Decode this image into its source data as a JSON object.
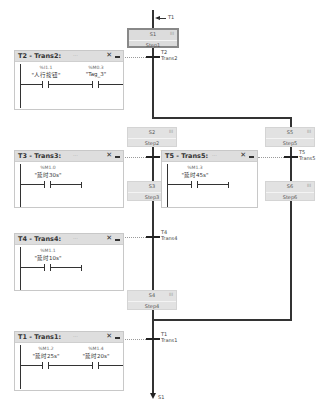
{
  "top_jump": {
    "label": "T1"
  },
  "bottom_jump": {
    "label": "S1"
  },
  "steps": [
    {
      "id": "S1",
      "name": "Step1",
      "initial": true
    },
    {
      "id": "S2",
      "name": "Step2"
    },
    {
      "id": "S3",
      "name": "Step3"
    },
    {
      "id": "S4",
      "name": "Step4"
    },
    {
      "id": "S5",
      "name": "Step5"
    },
    {
      "id": "S6",
      "name": "Step6"
    }
  ],
  "step_action_icon": "III",
  "transitions": [
    {
      "id": "T2",
      "name": "Trans2"
    },
    {
      "id": "T3",
      "name": "Trans3"
    },
    {
      "id": "T4",
      "name": "Trans4"
    },
    {
      "id": "T5",
      "name": "Trans5"
    },
    {
      "id": "T1",
      "name": "Trans1"
    }
  ],
  "panels": {
    "t2": {
      "title": "T2 - Trans2:",
      "dots": "...",
      "close": "✕",
      "contacts": [
        {
          "address": "%I1.1",
          "symbol": "\"人行按钮\""
        },
        {
          "address": "%M0.3",
          "symbol": "\"Tag_3\""
        }
      ]
    },
    "t3": {
      "title": "T3 - Trans3:",
      "dots": "...",
      "close": "✕",
      "contacts": [
        {
          "address": "%M1.0",
          "symbol": "\"延时30s\""
        }
      ]
    },
    "t5": {
      "title": "T5 - Trans5:",
      "dots": "...",
      "close": "✕",
      "contacts": [
        {
          "address": "%M1.3",
          "symbol": "\"延时45s\""
        }
      ]
    },
    "t4": {
      "title": "T4 - Trans4:",
      "dots": "...",
      "close": "✕",
      "contacts": [
        {
          "address": "%M1.1",
          "symbol": "\"延时10s\""
        }
      ]
    },
    "t1": {
      "title": "T1 - Trans1:",
      "dots": "...",
      "close": "✕",
      "contacts": [
        {
          "address": "%M1.2",
          "symbol": "\"延时25s\""
        },
        {
          "address": "%M1.4",
          "symbol": "\"延时20s\""
        }
      ]
    }
  }
}
